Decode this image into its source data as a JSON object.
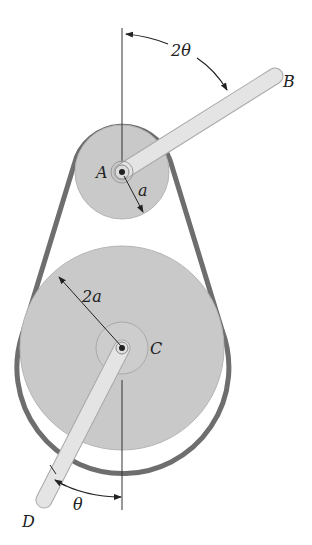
{
  "figure": {
    "type": "belt-pulley-mechanism",
    "labels": {
      "angle_top": "2θ",
      "point_B": "B",
      "point_A": "A",
      "radius_small": "a",
      "radius_large": "2a",
      "point_C": "C",
      "point_D": "D",
      "angle_bottom": "θ"
    },
    "colors": {
      "pulley_fill": "#c9c9c9",
      "belt": "#6e6e6e",
      "bar_fill": "#e4e4e4",
      "bar_stroke": "#a8a8a8",
      "line": "#333333",
      "background": "#ffffff"
    },
    "geometry": {
      "pulley_A": {
        "cx": 122,
        "cy": 172,
        "r": 47
      },
      "pulley_C": {
        "cx": 122,
        "cy": 348,
        "r": 102
      },
      "bar_AB_end": {
        "x": 275,
        "y": 76
      },
      "bar_CD_end": {
        "x": 44,
        "y": 500
      }
    }
  }
}
